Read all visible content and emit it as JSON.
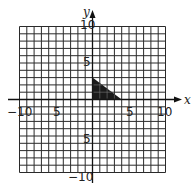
{
  "chart_data": {
    "type": "scatter",
    "title": "",
    "xlabel": "x",
    "ylabel": "y",
    "xlim": [
      -10,
      10
    ],
    "ylim": [
      -10,
      10
    ],
    "grid": true,
    "grid_step": 1,
    "x_tick_labels": [
      "-10",
      "5",
      "5",
      "10"
    ],
    "x_tick_values": [
      -10,
      -5,
      5,
      10
    ],
    "y_tick_labels": [
      "10",
      "5",
      "5",
      "-10"
    ],
    "y_tick_values": [
      10,
      5,
      -5,
      -10
    ],
    "shapes": [
      {
        "kind": "polygon",
        "name": "shaded right triangle",
        "vertices": [
          [
            0,
            0
          ],
          [
            0,
            3
          ],
          [
            4,
            0
          ]
        ],
        "fill": "#1a1a1a"
      }
    ]
  },
  "labels": {
    "x_axis": "x",
    "y_axis": "y",
    "x_neg10": "−10",
    "x_neg5": "5",
    "x_pos5": "5",
    "x_pos10": "10",
    "y_pos10": "10",
    "y_pos5": "5",
    "y_neg5": "5",
    "y_neg10": "−10"
  },
  "colors": {
    "grid": "#2a2a2a",
    "axis": "#111111",
    "shape_fill": "#1a1a1a"
  }
}
